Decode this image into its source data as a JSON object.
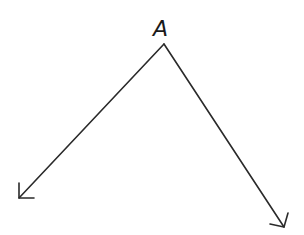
{
  "diagram": {
    "type": "angle",
    "vertex": {
      "label": "A",
      "x": 164,
      "y": 44
    },
    "label_position": {
      "x": 153,
      "y": 18
    },
    "rays": [
      {
        "name": "left-ray",
        "from": [
          164,
          44
        ],
        "to": [
          19,
          198
        ],
        "head": [
          [
            19,
            183
          ],
          [
            19,
            198
          ],
          [
            34,
            198
          ]
        ]
      },
      {
        "name": "right-ray",
        "from": [
          164,
          44
        ],
        "to": [
          284,
          227
        ],
        "head": [
          [
            288,
            213
          ],
          [
            284,
            227
          ],
          [
            270,
            224
          ]
        ]
      }
    ],
    "stroke_color": "#2a2a2a",
    "background": "#ffffff"
  }
}
